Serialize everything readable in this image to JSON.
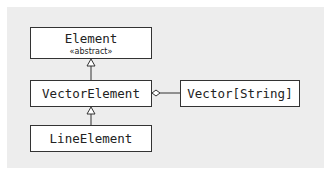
{
  "diagram": {
    "type": "UML class diagram",
    "classes": [
      {
        "name": "Element",
        "stereotype": "«abstract»"
      },
      {
        "name": "VectorElement"
      },
      {
        "name": "LineElement"
      },
      {
        "name": "Vector[String]"
      }
    ],
    "relations": [
      {
        "from": "VectorElement",
        "to": "Element",
        "kind": "generalization"
      },
      {
        "from": "LineElement",
        "to": "VectorElement",
        "kind": "generalization"
      },
      {
        "from": "VectorElement",
        "to": "Vector[String]",
        "kind": "aggregation"
      }
    ]
  }
}
